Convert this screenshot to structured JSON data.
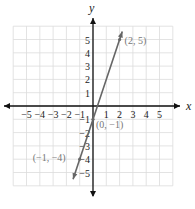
{
  "chart_data": {
    "type": "line",
    "title": "",
    "xlabel": "x",
    "ylabel": "y",
    "xlim": [
      -6,
      6
    ],
    "ylim": [
      -6,
      6
    ],
    "grid": true,
    "x_ticks": [
      -5,
      -4,
      -3,
      -2,
      -1,
      1,
      2,
      3,
      4,
      5
    ],
    "y_ticks": [
      5,
      4,
      3,
      2,
      1,
      -1,
      -2,
      -3,
      -4,
      -5
    ],
    "x_tick_labels": [
      "−5",
      "−4",
      "−3",
      "−2",
      "−1",
      "1",
      "2",
      "3",
      "4",
      "5"
    ],
    "y_tick_labels": [
      "5",
      "4",
      "3",
      "2",
      "1",
      "−1",
      "−2",
      "−3",
      "−4",
      "−5"
    ],
    "series": [
      {
        "name": "y = 3x − 1",
        "x": [
          -1.5,
          2.2
        ],
        "y": [
          -5.5,
          5.6
        ],
        "color": "#666666"
      }
    ],
    "points": [
      {
        "x": 2,
        "y": 5,
        "label": "(2, 5)"
      },
      {
        "x": 0,
        "y": -1,
        "label": "(0, −1)"
      },
      {
        "x": -1,
        "y": -4,
        "label": "(−1, −4)"
      }
    ]
  },
  "colors": {
    "axis": "#111111",
    "grid": "#dcdcdc",
    "line": "#666666",
    "label": "#777777"
  }
}
